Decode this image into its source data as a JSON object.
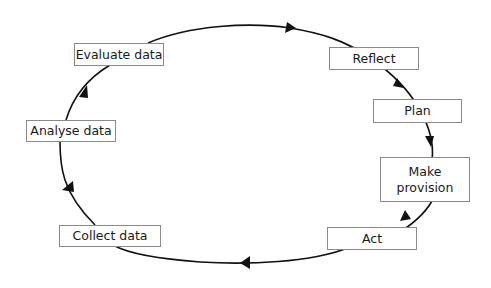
{
  "diagram": {
    "type": "cycle",
    "colors": {
      "line": "#111111",
      "box_border": "#8a8a8a",
      "text": "#1a1a1a",
      "background": "#ffffff"
    },
    "nodes": [
      {
        "id": "evaluate",
        "label": "Evaluate data"
      },
      {
        "id": "reflect",
        "label": "Reflect"
      },
      {
        "id": "plan",
        "label": "Plan"
      },
      {
        "id": "make-provision",
        "label": "Make\nprovision"
      },
      {
        "id": "act",
        "label": "Act"
      },
      {
        "id": "collect",
        "label": "Collect data"
      },
      {
        "id": "analyse",
        "label": "Analyse data"
      }
    ],
    "flow": [
      "Evaluate data",
      "Reflect",
      "Plan",
      "Make provision",
      "Act",
      "Collect data",
      "Analyse data",
      "Evaluate data"
    ],
    "direction": "clockwise"
  }
}
